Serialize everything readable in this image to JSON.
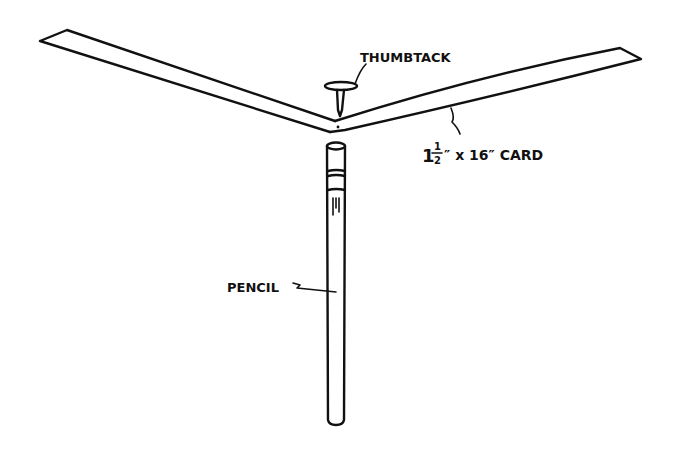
{
  "figure": {
    "labels": {
      "thumbtack": "THUMBTACK",
      "card_size_whole": "1",
      "card_size_num": "1",
      "card_size_den": "2",
      "card_size_rest": "″ x 16″ CARD",
      "pencil": "PENCIL"
    },
    "parts": [
      "card",
      "thumbtack",
      "pencil"
    ],
    "ink_color": "#111111",
    "background_color": "#ffffff"
  }
}
